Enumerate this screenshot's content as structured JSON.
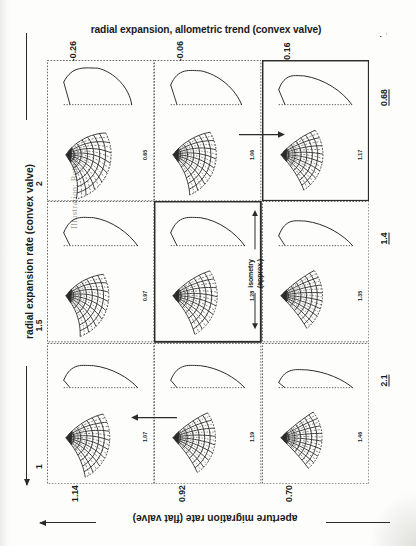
{
  "figure": {
    "running_head": "Illustration; Bottom",
    "top_axis": {
      "label": "radial expansion, allometric trend (convex valve)",
      "arrow": "right",
      "ticks": [
        "-0.26",
        "-0.06",
        "0.16"
      ]
    },
    "left_axis": {
      "label": "radial expansion rate (convex valve)",
      "arrow": "down",
      "ticks": [
        "2",
        "1.5",
        "1"
      ]
    },
    "bottom_axis": {
      "label": "aperture migration rate (flat valve)",
      "arrow": "left",
      "ticks": [
        "1.14",
        "0.92",
        "0.70"
      ]
    },
    "right_axis": {
      "ticks": [
        "0.68",
        "1.4",
        "2.1"
      ]
    },
    "annotation": {
      "isometry_label_line1": "isometry",
      "isometry_label_line2": "(approx.)"
    },
    "colors": {
      "ink": "#2b2b2b",
      "paper": "#fdfdfc",
      "highlight_border": "#111111"
    }
  },
  "grid": {
    "rows": [
      {
        "row_tick": "2",
        "right_tick": "0.68",
        "cells": [
          {
            "col_tick": "-0.26",
            "value": "0.65",
            "shape": "broad-dome",
            "mesh_span": 105,
            "mesh_radius": 1.0,
            "mesh_curl": 0.4,
            "highlight": false
          },
          {
            "col_tick": "-0.06",
            "value": "1.06",
            "shape": "wide-dome",
            "mesh_span": 98,
            "mesh_radius": 0.96,
            "mesh_curl": 0.3,
            "highlight": false
          },
          {
            "col_tick": "0.16",
            "value": "1.17",
            "shape": "low-dome",
            "mesh_span": 92,
            "mesh_radius": 0.93,
            "mesh_curl": 0.18,
            "highlight": true
          }
        ]
      },
      {
        "row_tick": "1.5",
        "right_tick": "1.4",
        "cells": [
          {
            "col_tick": "-0.26",
            "value": "0.97",
            "shape": "blade",
            "mesh_span": 100,
            "mesh_radius": 0.95,
            "mesh_curl": 0.34,
            "highlight": false
          },
          {
            "col_tick": "-0.06",
            "value": "1.28",
            "shape": "blade",
            "mesh_span": 94,
            "mesh_radius": 0.98,
            "mesh_curl": 0.22,
            "highlight": true
          },
          {
            "col_tick": "0.16",
            "value": "1.35",
            "shape": "blade-thin",
            "mesh_span": 88,
            "mesh_radius": 0.92,
            "mesh_curl": 0.12,
            "highlight": false
          }
        ]
      },
      {
        "row_tick": "1",
        "right_tick": "2.1",
        "cells": [
          {
            "col_tick": "-0.26",
            "value": "1.07",
            "shape": "sliver",
            "mesh_span": 96,
            "mesh_radius": 0.97,
            "mesh_curl": 0.26,
            "highlight": false
          },
          {
            "col_tick": "-0.06",
            "value": "1.19",
            "shape": "sliver",
            "mesh_span": 90,
            "mesh_radius": 0.94,
            "mesh_curl": 0.16,
            "highlight": false
          },
          {
            "col_tick": "0.16",
            "value": "1.46",
            "shape": "sliver-thin",
            "mesh_span": 86,
            "mesh_radius": 0.91,
            "mesh_curl": 0.08,
            "highlight": false
          }
        ]
      }
    ],
    "transitions": [
      {
        "row": 0,
        "between": "col2-col3",
        "direction": "right"
      },
      {
        "row": 2,
        "between": "col1-col2",
        "direction": "left"
      }
    ]
  }
}
